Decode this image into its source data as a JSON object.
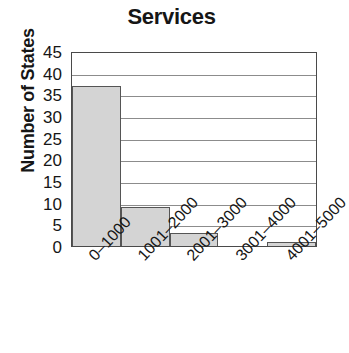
{
  "chart_data": {
    "type": "bar",
    "title": "Services",
    "xlabel": "",
    "ylabel": "Number of States",
    "categories": [
      "0–1000",
      "1001–2000",
      "2001–3000",
      "3001–4000",
      "4001–5000"
    ],
    "values": [
      37,
      9,
      3,
      0,
      1
    ],
    "ylim": [
      0,
      45
    ],
    "yticks": [
      0,
      5,
      10,
      15,
      20,
      25,
      30,
      35,
      40,
      45
    ],
    "ytick_labels": [
      "0",
      "5",
      "10",
      "15",
      "20",
      "25",
      "30",
      "35",
      "40",
      "45"
    ],
    "grid": true,
    "legend": false,
    "bar_fill_color": "#d4d4d4",
    "bar_edge_color": "#555555",
    "gridline_color": "#8c8c8c",
    "axis_color": "#4a4a4a",
    "background_color": "#ffffff",
    "text_color": "#161616"
  }
}
